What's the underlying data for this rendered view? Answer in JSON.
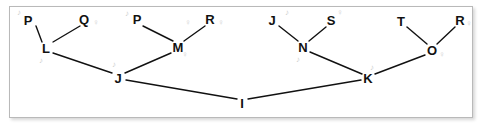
{
  "diagram": {
    "background": "#ffffff",
    "panel_border_color": "#b9b9b9",
    "edge_color": "#111111",
    "node_color": "#111111",
    "ghost_color": "#d2d2d2",
    "nodes": [
      {
        "id": "n_P1",
        "label": "P",
        "x": 28,
        "y": 20
      },
      {
        "id": "n_Q",
        "label": "Q",
        "x": 84,
        "y": 19
      },
      {
        "id": "n_P2",
        "label": "P",
        "x": 137,
        "y": 19
      },
      {
        "id": "n_R1",
        "label": "R",
        "x": 210,
        "y": 19
      },
      {
        "id": "n_J2",
        "label": "J",
        "x": 272,
        "y": 20
      },
      {
        "id": "n_S",
        "label": "S",
        "x": 331,
        "y": 20
      },
      {
        "id": "n_T",
        "label": "T",
        "x": 401,
        "y": 21
      },
      {
        "id": "n_R2",
        "label": "R",
        "x": 460,
        "y": 20
      },
      {
        "id": "n_L",
        "label": "L",
        "x": 46,
        "y": 48
      },
      {
        "id": "n_M",
        "label": "M",
        "x": 178,
        "y": 47
      },
      {
        "id": "n_N",
        "label": "N",
        "x": 303,
        "y": 47
      },
      {
        "id": "n_O",
        "label": "O",
        "x": 432,
        "y": 50
      },
      {
        "id": "n_J1",
        "label": "J",
        "x": 118,
        "y": 78
      },
      {
        "id": "n_K",
        "label": "K",
        "x": 368,
        "y": 78
      },
      {
        "id": "n_I",
        "label": "I",
        "x": 242,
        "y": 103
      }
    ],
    "edges": [
      {
        "from": "n_P1",
        "to": "n_L",
        "x1": 36,
        "y1": 26,
        "x2": 42,
        "y2": 42
      },
      {
        "from": "n_Q",
        "to": "n_L",
        "x1": 80,
        "y1": 26,
        "x2": 53,
        "y2": 42
      },
      {
        "from": "n_L",
        "to": "n_J1",
        "x1": 53,
        "y1": 53,
        "x2": 112,
        "y2": 73
      },
      {
        "from": "n_P2",
        "to": "n_M",
        "x1": 143,
        "y1": 26,
        "x2": 173,
        "y2": 41
      },
      {
        "from": "n_R1",
        "to": "n_M",
        "x1": 205,
        "y1": 26,
        "x2": 184,
        "y2": 41
      },
      {
        "from": "n_M",
        "to": "n_J1",
        "x1": 171,
        "y1": 53,
        "x2": 125,
        "y2": 73
      },
      {
        "from": "n_J1",
        "to": "n_I",
        "x1": 126,
        "y1": 80,
        "x2": 237,
        "y2": 99
      },
      {
        "from": "n_J2",
        "to": "n_N",
        "x1": 279,
        "y1": 26,
        "x2": 298,
        "y2": 41
      },
      {
        "from": "n_S",
        "to": "n_N",
        "x1": 326,
        "y1": 27,
        "x2": 309,
        "y2": 41
      },
      {
        "from": "n_N",
        "to": "n_K",
        "x1": 310,
        "y1": 52,
        "x2": 362,
        "y2": 74
      },
      {
        "from": "n_T",
        "to": "n_O",
        "x1": 407,
        "y1": 27,
        "x2": 427,
        "y2": 44
      },
      {
        "from": "n_R2",
        "to": "n_O",
        "x1": 455,
        "y1": 27,
        "x2": 437,
        "y2": 44
      },
      {
        "from": "n_O",
        "to": "n_K",
        "x1": 425,
        "y1": 55,
        "x2": 375,
        "y2": 74
      },
      {
        "from": "n_K",
        "to": "n_I",
        "x1": 361,
        "y1": 80,
        "x2": 248,
        "y2": 99
      }
    ],
    "ghost_marks": [
      {
        "label": "♪",
        "x": 19,
        "y": 13
      },
      {
        "label": "♪",
        "x": 41,
        "y": 61
      },
      {
        "label": "♀",
        "x": 96,
        "y": 23
      },
      {
        "label": "♪",
        "x": 127,
        "y": 14
      },
      {
        "label": "♀",
        "x": 188,
        "y": 23
      },
      {
        "label": "♀",
        "x": 221,
        "y": 23
      },
      {
        "label": "♀",
        "x": 185,
        "y": 55
      },
      {
        "label": "♪",
        "x": 114,
        "y": 65
      },
      {
        "label": "♪",
        "x": 287,
        "y": 13
      },
      {
        "label": "♀",
        "x": 340,
        "y": 13
      },
      {
        "label": "♪",
        "x": 298,
        "y": 60
      },
      {
        "label": "♀",
        "x": 469,
        "y": 24
      },
      {
        "label": "♀",
        "x": 442,
        "y": 55
      },
      {
        "label": "♪",
        "x": 372,
        "y": 68
      }
    ]
  }
}
